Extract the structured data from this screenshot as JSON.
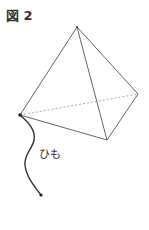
{
  "figure": {
    "label": "図 2",
    "string_label": "ひも",
    "colors": {
      "edge": "#555555",
      "hidden_edge": "#888888",
      "string": "#333333"
    }
  }
}
